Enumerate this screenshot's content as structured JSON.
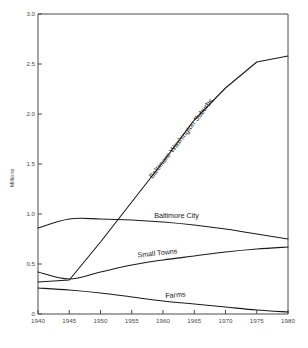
{
  "chart_data": {
    "type": "line",
    "title": "",
    "xlabel": "",
    "ylabel": "Millions",
    "xlim": [
      1940,
      1980
    ],
    "ylim": [
      0,
      3.0
    ],
    "grid": false,
    "legend_position": "inline-labels",
    "x_ticks": [
      "1940",
      "1945",
      "1950",
      "1955",
      "1960",
      "1965",
      "1970",
      "1975",
      "1980"
    ],
    "x_tick_values": [
      1940,
      1945,
      1950,
      1955,
      1960,
      1965,
      1970,
      1975,
      1980
    ],
    "y_ticks": [
      "0",
      "0.5",
      "1.0",
      "1.5",
      "2.0",
      "2.5",
      "3.0"
    ],
    "y_tick_values": [
      0,
      0.5,
      1.0,
      1.5,
      2.0,
      2.5,
      3.0
    ],
    "x": [
      1940,
      1945,
      1950,
      1955,
      1960,
      1965,
      1970,
      1975,
      1980
    ],
    "series": [
      {
        "name": "Baltimore-Washington Suburbs",
        "label": "Baltimore-Washington Suburbs",
        "label_rotation": -52,
        "values": [
          0.32,
          0.34,
          0.72,
          1.12,
          1.52,
          1.94,
          2.26,
          2.52,
          2.58
        ]
      },
      {
        "name": "Baltimore City",
        "label": "Baltimore City",
        "label_rotation": 0,
        "values": [
          0.86,
          0.95,
          0.95,
          0.94,
          0.92,
          0.89,
          0.85,
          0.8,
          0.75
        ]
      },
      {
        "name": "Small Towns",
        "label": "Small Towns",
        "label_rotation": -6,
        "values": [
          0.42,
          0.35,
          0.42,
          0.49,
          0.54,
          0.58,
          0.62,
          0.65,
          0.67
        ]
      },
      {
        "name": "Farms",
        "label": "Farms",
        "label_rotation": -5,
        "values": [
          0.26,
          0.24,
          0.21,
          0.17,
          0.13,
          0.1,
          0.07,
          0.04,
          0.02
        ]
      }
    ]
  },
  "colors": {
    "line": "#1a1a1a",
    "axis": "#4a4a4a",
    "background": "#ffffff",
    "tick_text": "#4a4a4a"
  }
}
